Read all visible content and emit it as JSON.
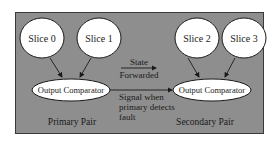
{
  "diagram": {
    "type": "block-diagram",
    "primary_pair": {
      "label": "Primary Pair",
      "slices": [
        "Slice 0",
        "Slice 1"
      ],
      "comparator": "Output Comparator"
    },
    "secondary_pair": {
      "label": "Secondary Pair",
      "slices": [
        "Slice 2",
        "Slice 3"
      ],
      "comparator": "Output Comparator"
    },
    "edges": [
      {
        "from": "Slice 0",
        "to": "Primary Output Comparator"
      },
      {
        "from": "Slice 1",
        "to": "Primary Output Comparator"
      },
      {
        "from": "Slice 2",
        "to": "Secondary Output Comparator"
      },
      {
        "from": "Slice 3",
        "to": "Secondary Output Comparator"
      },
      {
        "from": "Primary Pair",
        "to": "Secondary Pair",
        "label_line1": "State",
        "label_line2": "Forwarded"
      },
      {
        "from": "Primary Output Comparator",
        "to": "Secondary Output Comparator",
        "label_line1": "Signal when",
        "label_line2": "primary detects",
        "label_line3": "fault"
      }
    ],
    "colors": {
      "background": "#8e8e8e",
      "node_fill": "#ffffff",
      "stroke": "#1a1a1a"
    }
  }
}
